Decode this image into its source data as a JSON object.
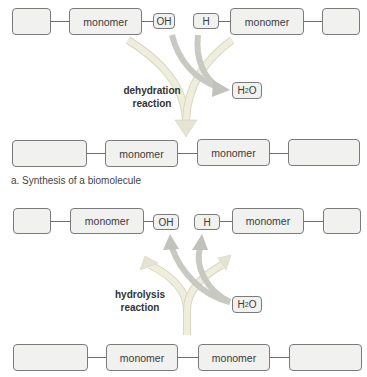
{
  "panel_a": {
    "top_row": {
      "box_left": "",
      "monomer_left": "monomer",
      "group_oh": "OH",
      "group_h": "H",
      "monomer_right": "monomer",
      "box_right": ""
    },
    "reaction_label_line1": "dehydration",
    "reaction_label_line2": "reaction",
    "water": {
      "main": "H",
      "sub": "2",
      "tail": "O"
    },
    "bottom_row": {
      "box_left": "",
      "monomer_left": "monomer",
      "monomer_right": "monomer",
      "box_right": ""
    },
    "caption": "a. Synthesis of a biomolecule"
  },
  "panel_b": {
    "top_row": {
      "box_left": "",
      "monomer_left": "monomer",
      "group_oh": "OH",
      "group_h": "H",
      "monomer_right": "monomer",
      "box_right": ""
    },
    "reaction_label_line1": "hydrolysis",
    "reaction_label_line2": "reaction",
    "water": {
      "main": "H",
      "sub": "2",
      "tail": "O"
    },
    "bottom_row": {
      "box_left": "",
      "monomer_left": "monomer",
      "monomer_right": "monomer",
      "box_right": ""
    }
  },
  "colors": {
    "arrow_light": "#ecebd6",
    "arrow_gray": "#c9c9c4",
    "box_fill": "#f1f1f0",
    "box_border": "#7a7a7a"
  }
}
